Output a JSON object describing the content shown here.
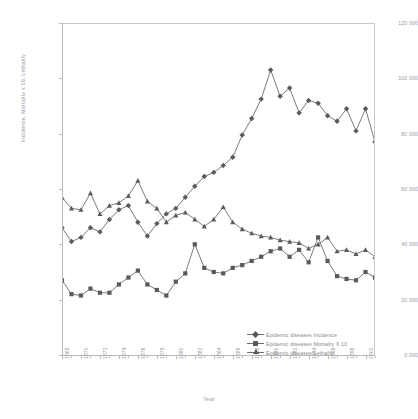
{
  "chart_data": {
    "type": "line",
    "title": "",
    "xlabel": "Year",
    "ylabel": "Incidence, Mortality x 10, Lethality",
    "xlim": [
      1868,
      1901
    ],
    "ylim": [
      0,
      120000
    ],
    "ytick_step": 20000,
    "grid": false,
    "legend_position": "bottom-right",
    "ytick_labels": [
      "0,000",
      "20 000",
      "40 000",
      "60 000",
      "80 000",
      "100 000",
      "120 000"
    ],
    "ytick_values": [
      0,
      20000,
      40000,
      60000,
      80000,
      100000,
      120000
    ],
    "xtick_labels": [
      "1868",
      "1870",
      "1872",
      "1874",
      "1876",
      "1878",
      "1880",
      "1882",
      "1884",
      "1886",
      "1888",
      "1890",
      "1892",
      "1894",
      "1896",
      "1898",
      "1900"
    ],
    "xtick_values": [
      1868,
      1870,
      1872,
      1874,
      1876,
      1878,
      1880,
      1882,
      1884,
      1886,
      1888,
      1890,
      1892,
      1894,
      1896,
      1898,
      1900
    ],
    "x": [
      1868,
      1869,
      1870,
      1871,
      1872,
      1873,
      1874,
      1875,
      1876,
      1877,
      1878,
      1879,
      1880,
      1881,
      1882,
      1883,
      1884,
      1885,
      1886,
      1887,
      1888,
      1889,
      1890,
      1891,
      1892,
      1893,
      1894,
      1895,
      1896,
      1897,
      1898,
      1899,
      1900,
      1901
    ],
    "series": [
      {
        "name": "Epidemic diseases Incidence",
        "marker": "diamond",
        "color": "#5a5a5a",
        "values": [
          46000,
          41000,
          42500,
          46000,
          44500,
          49000,
          52500,
          54000,
          48000,
          43000,
          47500,
          51000,
          53000,
          57000,
          61000,
          64500,
          66000,
          68500,
          71500,
          79500,
          85500,
          92500,
          103000,
          93500,
          96500,
          87500,
          92000,
          91000,
          86500,
          84500,
          89000,
          81000,
          89000,
          77000
        ]
      },
      {
        "name": "Epidemic diseases Mortality X 10",
        "marker": "square",
        "color": "#5a5a5a",
        "values": [
          27000,
          22000,
          21500,
          24000,
          22500,
          22500,
          25500,
          28000,
          30500,
          25500,
          23500,
          21500,
          26500,
          29500,
          40000,
          31500,
          30000,
          29500,
          31500,
          32500,
          34000,
          35500,
          37500,
          38500,
          35500,
          38000,
          33500,
          42500,
          34000,
          28500,
          27500,
          27000,
          30000,
          28000
        ]
      },
      {
        "name": "Epidemic diseases Lethality",
        "marker": "triangle",
        "color": "#5a5a5a",
        "values": [
          57000,
          53000,
          52500,
          58500,
          51000,
          54000,
          55000,
          57500,
          63000,
          55500,
          53000,
          48000,
          50500,
          51500,
          49000,
          46500,
          49000,
          53500,
          48000,
          45500,
          44000,
          43000,
          42500,
          41500,
          41000,
          40500,
          38500,
          40000,
          42500,
          37500,
          38000,
          36500,
          38000,
          35500
        ]
      }
    ]
  },
  "legend": {
    "items": [
      {
        "label": "Epidemic diseases Incidence",
        "marker": "diamond"
      },
      {
        "label": "Epidemic diseases Mortality X 10",
        "marker": "square"
      },
      {
        "label": "Epidemic diseases Lethality",
        "marker": "triangle"
      }
    ]
  }
}
